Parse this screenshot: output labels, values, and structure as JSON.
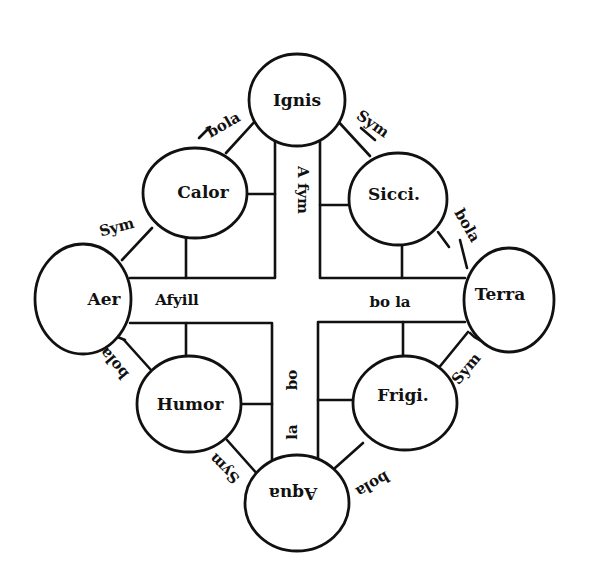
{
  "diagram": {
    "nodes": {
      "ignis": "Ignis",
      "calor": "Calor",
      "sicci": "Sicci.",
      "aer": "Aer",
      "terra": "Terra",
      "humor": "Humor",
      "frigi": "Frigi.",
      "aqua": "Aqua"
    },
    "cross": {
      "top": "A fym",
      "left": "Afyill",
      "right": "bo la",
      "bottom_bo": "bo",
      "bottom_la": "la"
    },
    "edges": {
      "ignis_calor": "bola",
      "ignis_sicci": "Sym",
      "calor_aer": "Sym",
      "sicci_terra": "bola",
      "aer_humor": "bola",
      "terra_frigi": "Sym",
      "humor_aqua": "Sym",
      "frigi_aqua": "bola"
    },
    "colors": {
      "ink": "#111111",
      "paper": "#ffffff"
    }
  }
}
